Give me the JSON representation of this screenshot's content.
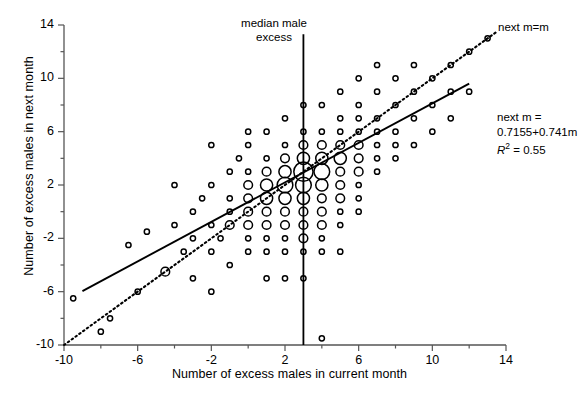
{
  "chart_data": {
    "type": "scatter",
    "title": "",
    "xlabel": "Number of excess males in current month",
    "ylabel": "Number of excess males in next month",
    "xlim": [
      -10,
      14
    ],
    "ylim": [
      -10,
      14
    ],
    "xticks": [
      -10,
      -6,
      -2,
      2,
      6,
      10,
      14
    ],
    "yticks": [
      -10,
      -6,
      -2,
      2,
      6,
      10,
      14
    ],
    "xtick_labels": [
      "-10",
      "-6",
      "-2",
      "2",
      "6",
      "10",
      "14"
    ],
    "ytick_labels": [
      "-10",
      "-6",
      "-2",
      "2",
      "6",
      "10",
      "14"
    ],
    "minor_tick_step": 2,
    "grid": false,
    "legend": "none",
    "marker": "open-circle",
    "point_size_encodes_count": true,
    "annotations": [
      {
        "name": "median-male-excess",
        "text_line1": "median male",
        "text_line2": "excess",
        "x": 3
      },
      {
        "name": "identity-line-label",
        "text": "next m=m"
      },
      {
        "name": "regression-equation-line1",
        "text": "next m ="
      },
      {
        "name": "regression-equation-line2",
        "text": "0.7155+0.741m"
      },
      {
        "name": "r-squared",
        "text_prefix": "R",
        "text_exponent": "2",
        "text_suffix": " = 0.55"
      }
    ],
    "lines": [
      {
        "name": "regression-line",
        "style": "solid",
        "intercept": 0.7155,
        "slope": 0.741,
        "x_start": -9.0,
        "x_end": 12.0
      },
      {
        "name": "identity-line",
        "style": "dotted",
        "intercept": 0,
        "slope": 1,
        "x_start": -10.0,
        "x_end": 13.5
      },
      {
        "name": "median-vertical-line",
        "style": "solid",
        "x": 3,
        "y_start": -10,
        "y_end": 13.3
      }
    ],
    "points": [
      {
        "x": -9.5,
        "y": -6.5,
        "n": 1
      },
      {
        "x": -8.0,
        "y": -9.0,
        "n": 1
      },
      {
        "x": -6.5,
        "y": -2.5,
        "n": 1
      },
      {
        "x": -6.0,
        "y": -6.0,
        "n": 1
      },
      {
        "x": -5.5,
        "y": -1.5,
        "n": 1
      },
      {
        "x": -4.5,
        "y": -4.5,
        "n": 2
      },
      {
        "x": -4.0,
        "y": -1.0,
        "n": 1
      },
      {
        "x": -3.5,
        "y": -3.0,
        "n": 1
      },
      {
        "x": -3.0,
        "y": -2.0,
        "n": 1
      },
      {
        "x": -3.0,
        "y": 0.0,
        "n": 1
      },
      {
        "x": -3.0,
        "y": -5.0,
        "n": 1
      },
      {
        "x": -2.5,
        "y": 1.0,
        "n": 1
      },
      {
        "x": -2.0,
        "y": -1.0,
        "n": 1
      },
      {
        "x": -2.0,
        "y": -3.0,
        "n": 1
      },
      {
        "x": -2.0,
        "y": 2.0,
        "n": 1
      },
      {
        "x": -2.0,
        "y": 5.0,
        "n": 1
      },
      {
        "x": -1.5,
        "y": -2.0,
        "n": 1
      },
      {
        "x": -1.0,
        "y": 0.0,
        "n": 1
      },
      {
        "x": -1.0,
        "y": -4.0,
        "n": 1
      },
      {
        "x": -1.0,
        "y": 3.0,
        "n": 1
      },
      {
        "x": -1.0,
        "y": 1.0,
        "n": 1
      },
      {
        "x": -1.0,
        "y": -1.0,
        "n": 2
      },
      {
        "x": -0.5,
        "y": 4.0,
        "n": 1
      },
      {
        "x": 0.0,
        "y": 2.0,
        "n": 2
      },
      {
        "x": 0.0,
        "y": 0.0,
        "n": 2
      },
      {
        "x": 0.0,
        "y": -1.0,
        "n": 2
      },
      {
        "x": 0.0,
        "y": -2.0,
        "n": 1
      },
      {
        "x": 0.0,
        "y": -3.0,
        "n": 1
      },
      {
        "x": 0.0,
        "y": 3.0,
        "n": 1
      },
      {
        "x": 0.0,
        "y": 5.0,
        "n": 1
      },
      {
        "x": 0.0,
        "y": 1.0,
        "n": 2
      },
      {
        "x": 1.0,
        "y": 3.0,
        "n": 2
      },
      {
        "x": 1.0,
        "y": 2.0,
        "n": 3
      },
      {
        "x": 1.0,
        "y": 1.0,
        "n": 3
      },
      {
        "x": 1.0,
        "y": 0.0,
        "n": 2
      },
      {
        "x": 1.0,
        "y": -1.0,
        "n": 2
      },
      {
        "x": 1.0,
        "y": -2.0,
        "n": 1
      },
      {
        "x": 1.0,
        "y": -3.0,
        "n": 1
      },
      {
        "x": 1.0,
        "y": 4.0,
        "n": 1
      },
      {
        "x": 1.0,
        "y": 6.0,
        "n": 1
      },
      {
        "x": 2.0,
        "y": 4.0,
        "n": 2
      },
      {
        "x": 2.0,
        "y": 3.0,
        "n": 3
      },
      {
        "x": 2.0,
        "y": 2.0,
        "n": 4
      },
      {
        "x": 2.0,
        "y": 1.0,
        "n": 3
      },
      {
        "x": 2.0,
        "y": 0.0,
        "n": 2
      },
      {
        "x": 2.0,
        "y": -1.0,
        "n": 2
      },
      {
        "x": 2.0,
        "y": -2.0,
        "n": 1
      },
      {
        "x": 2.0,
        "y": -3.0,
        "n": 1
      },
      {
        "x": 2.0,
        "y": 5.0,
        "n": 1
      },
      {
        "x": 2.0,
        "y": 7.0,
        "n": 1
      },
      {
        "x": 3.0,
        "y": 5.0,
        "n": 2
      },
      {
        "x": 3.0,
        "y": 4.0,
        "n": 3
      },
      {
        "x": 3.0,
        "y": 3.0,
        "n": 5
      },
      {
        "x": 3.0,
        "y": 2.0,
        "n": 4
      },
      {
        "x": 3.0,
        "y": 1.0,
        "n": 3
      },
      {
        "x": 3.0,
        "y": 0.0,
        "n": 2
      },
      {
        "x": 3.0,
        "y": -1.0,
        "n": 2
      },
      {
        "x": 3.0,
        "y": -2.0,
        "n": 2
      },
      {
        "x": 3.0,
        "y": -3.0,
        "n": 1
      },
      {
        "x": 3.0,
        "y": 6.0,
        "n": 1
      },
      {
        "x": 3.0,
        "y": 8.0,
        "n": 1
      },
      {
        "x": 3.0,
        "y": -5.0,
        "n": 1
      },
      {
        "x": 4.0,
        "y": 6.0,
        "n": 1
      },
      {
        "x": 4.0,
        "y": 5.0,
        "n": 2
      },
      {
        "x": 4.0,
        "y": 4.0,
        "n": 3
      },
      {
        "x": 4.0,
        "y": 3.0,
        "n": 4
      },
      {
        "x": 4.0,
        "y": 2.0,
        "n": 3
      },
      {
        "x": 4.0,
        "y": 1.0,
        "n": 2
      },
      {
        "x": 4.0,
        "y": 0.0,
        "n": 2
      },
      {
        "x": 4.0,
        "y": -1.0,
        "n": 2
      },
      {
        "x": 4.0,
        "y": -2.0,
        "n": 1
      },
      {
        "x": 4.0,
        "y": -3.0,
        "n": 1
      },
      {
        "x": 4.0,
        "y": 8.0,
        "n": 1
      },
      {
        "x": 4.0,
        "y": -9.5,
        "n": 1
      },
      {
        "x": 5.0,
        "y": 7.0,
        "n": 1
      },
      {
        "x": 5.0,
        "y": 6.0,
        "n": 1
      },
      {
        "x": 5.0,
        "y": 5.0,
        "n": 2
      },
      {
        "x": 5.0,
        "y": 4.0,
        "n": 3
      },
      {
        "x": 5.0,
        "y": 3.0,
        "n": 2
      },
      {
        "x": 5.0,
        "y": 2.0,
        "n": 2
      },
      {
        "x": 5.0,
        "y": 1.0,
        "n": 2
      },
      {
        "x": 5.0,
        "y": 0.0,
        "n": 1
      },
      {
        "x": 5.0,
        "y": -1.0,
        "n": 1
      },
      {
        "x": 5.0,
        "y": 9.0,
        "n": 1
      },
      {
        "x": 6.0,
        "y": 8.0,
        "n": 1
      },
      {
        "x": 6.0,
        "y": 7.0,
        "n": 1
      },
      {
        "x": 6.0,
        "y": 6.0,
        "n": 1
      },
      {
        "x": 6.0,
        "y": 5.0,
        "n": 2
      },
      {
        "x": 6.0,
        "y": 4.0,
        "n": 2
      },
      {
        "x": 6.0,
        "y": 3.0,
        "n": 2
      },
      {
        "x": 6.0,
        "y": 2.0,
        "n": 1
      },
      {
        "x": 6.0,
        "y": 1.0,
        "n": 1
      },
      {
        "x": 6.0,
        "y": 0.0,
        "n": 1
      },
      {
        "x": 6.0,
        "y": 10.0,
        "n": 1
      },
      {
        "x": 7.0,
        "y": 9.0,
        "n": 1
      },
      {
        "x": 7.0,
        "y": 7.0,
        "n": 1
      },
      {
        "x": 7.0,
        "y": 6.0,
        "n": 1
      },
      {
        "x": 7.0,
        "y": 5.0,
        "n": 1
      },
      {
        "x": 7.0,
        "y": 4.0,
        "n": 1
      },
      {
        "x": 7.0,
        "y": 3.0,
        "n": 1
      },
      {
        "x": 7.0,
        "y": 11.0,
        "n": 1
      },
      {
        "x": 8.0,
        "y": 10.0,
        "n": 1
      },
      {
        "x": 8.0,
        "y": 8.0,
        "n": 1
      },
      {
        "x": 8.0,
        "y": 6.0,
        "n": 1
      },
      {
        "x": 8.0,
        "y": 5.0,
        "n": 1
      },
      {
        "x": 8.0,
        "y": 4.0,
        "n": 1
      },
      {
        "x": 9.0,
        "y": 11.0,
        "n": 1
      },
      {
        "x": 9.0,
        "y": 9.0,
        "n": 1
      },
      {
        "x": 9.0,
        "y": 7.0,
        "n": 1
      },
      {
        "x": 9.0,
        "y": 5.0,
        "n": 1
      },
      {
        "x": 10.0,
        "y": 10.0,
        "n": 1
      },
      {
        "x": 10.0,
        "y": 8.0,
        "n": 1
      },
      {
        "x": 10.0,
        "y": 6.0,
        "n": 1
      },
      {
        "x": 11.0,
        "y": 11.0,
        "n": 1
      },
      {
        "x": 11.0,
        "y": 9.0,
        "n": 1
      },
      {
        "x": 11.0,
        "y": 7.0,
        "n": 1
      },
      {
        "x": 12.0,
        "y": 12.0,
        "n": 1
      },
      {
        "x": 12.0,
        "y": 9.0,
        "n": 1
      },
      {
        "x": 13.0,
        "y": 13.0,
        "n": 1
      },
      {
        "x": -7.5,
        "y": -8.0,
        "n": 1
      },
      {
        "x": 2.0,
        "y": -5.0,
        "n": 1
      },
      {
        "x": 1.0,
        "y": -5.0,
        "n": 1
      },
      {
        "x": -2.0,
        "y": -6.0,
        "n": 1
      },
      {
        "x": 5.0,
        "y": -3.0,
        "n": 1
      },
      {
        "x": 0.0,
        "y": 6.0,
        "n": 1
      },
      {
        "x": -4.0,
        "y": 2.0,
        "n": 1
      }
    ]
  },
  "axes": {
    "x_title": "Number of excess males in current month",
    "y_title": "Number of excess males in next month"
  },
  "annotations": {
    "median_line1": "median male",
    "median_line2": "excess",
    "identity": "next m=m",
    "fit_line1": "next m =",
    "fit_line2": "0.7155+0.741m",
    "r2_symbol": "R",
    "r2_exp": "2",
    "r2_value": " = 0.55"
  },
  "style": {
    "axis_color": "#555555",
    "marker_color": "#000000",
    "line_color": "#000000",
    "background": "#ffffff"
  }
}
